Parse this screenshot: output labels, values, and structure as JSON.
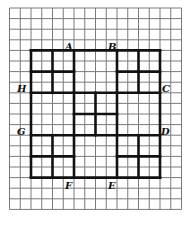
{
  "diagram": {
    "type": "grid-figure",
    "grid": {
      "columns": 16,
      "rows": 19,
      "origin_x": 9.5,
      "origin_y": 8,
      "cell_w": 10.75,
      "cell_h": 10.6,
      "line_color": "#7a7a7a"
    },
    "outline_color": "#111111",
    "thick_segments": [
      [
        2,
        4,
        14,
        4
      ],
      [
        2,
        16,
        14,
        16
      ],
      [
        2,
        4,
        2,
        16
      ],
      [
        14,
        4,
        14,
        16
      ],
      [
        2,
        8,
        14,
        8
      ],
      [
        2,
        12,
        14,
        12
      ],
      [
        4,
        4,
        4,
        8
      ],
      [
        6,
        4,
        6,
        8
      ],
      [
        10,
        4,
        10,
        8
      ],
      [
        12,
        4,
        12,
        8
      ],
      [
        2,
        6,
        6,
        6
      ],
      [
        10,
        6,
        14,
        6
      ],
      [
        6,
        8,
        6,
        12
      ],
      [
        8,
        8,
        8,
        12
      ],
      [
        10,
        8,
        10,
        12
      ],
      [
        6,
        10,
        10,
        10
      ],
      [
        4,
        12,
        4,
        16
      ],
      [
        6,
        12,
        6,
        16
      ],
      [
        10,
        12,
        10,
        16
      ],
      [
        12,
        12,
        12,
        16
      ],
      [
        2,
        14,
        6,
        14
      ],
      [
        10,
        14,
        14,
        14
      ]
    ],
    "labels": [
      {
        "text": "A",
        "x": 65,
        "y": 50
      },
      {
        "text": "B",
        "x": 108,
        "y": 50
      },
      {
        "text": "C",
        "x": 162,
        "y": 92
      },
      {
        "text": "D",
        "x": 161,
        "y": 135
      },
      {
        "text": "E",
        "x": 108,
        "y": 189
      },
      {
        "text": "F",
        "x": 65,
        "y": 189
      },
      {
        "text": "G",
        "x": 17,
        "y": 135
      },
      {
        "text": "H",
        "x": 17,
        "y": 92
      }
    ]
  }
}
